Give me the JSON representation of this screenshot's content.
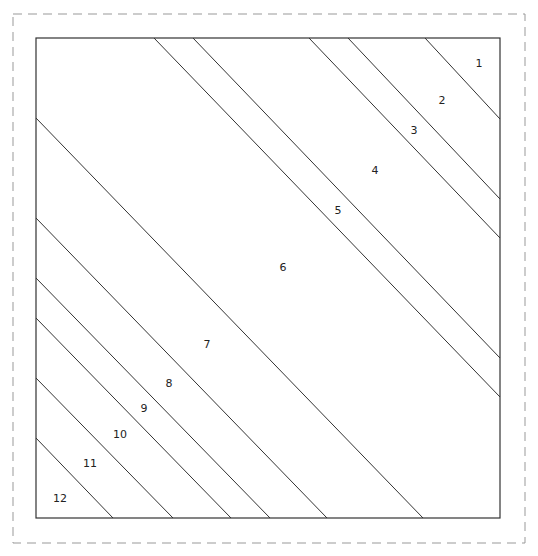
{
  "colors": {
    "background": "#ffffff",
    "outline": "#333333",
    "dashed_border": "#999999",
    "label": "#222222"
  },
  "outer_border": {
    "x": 13,
    "y": 14,
    "width": 512,
    "height": 529,
    "style": "dashed"
  },
  "square": {
    "x": 36,
    "y": 38,
    "width": 464,
    "height": 480
  },
  "lines": [
    {
      "x1": 425,
      "y1": 38,
      "x2": 500,
      "y2": 119
    },
    {
      "x1": 348,
      "y1": 38,
      "x2": 500,
      "y2": 199
    },
    {
      "x1": 309,
      "y1": 38,
      "x2": 500,
      "y2": 238
    },
    {
      "x1": 193,
      "y1": 38,
      "x2": 500,
      "y2": 358
    },
    {
      "x1": 154,
      "y1": 38,
      "x2": 500,
      "y2": 397
    },
    {
      "x1": 36,
      "y1": 118,
      "x2": 423,
      "y2": 518
    },
    {
      "x1": 36,
      "y1": 218,
      "x2": 327,
      "y2": 518
    },
    {
      "x1": 36,
      "y1": 278,
      "x2": 270,
      "y2": 518
    },
    {
      "x1": 36,
      "y1": 318,
      "x2": 231,
      "y2": 518
    },
    {
      "x1": 36,
      "y1": 378,
      "x2": 173,
      "y2": 518
    },
    {
      "x1": 36,
      "y1": 438,
      "x2": 113,
      "y2": 518
    }
  ],
  "regions": [
    {
      "label": "1",
      "x": 479,
      "y": 67
    },
    {
      "label": "2",
      "x": 442,
      "y": 104
    },
    {
      "label": "3",
      "x": 414,
      "y": 134
    },
    {
      "label": "4",
      "x": 375,
      "y": 174
    },
    {
      "label": "5",
      "x": 338,
      "y": 214
    },
    {
      "label": "6",
      "x": 283,
      "y": 271
    },
    {
      "label": "7",
      "x": 207,
      "y": 348
    },
    {
      "label": "8",
      "x": 169,
      "y": 387
    },
    {
      "label": "9",
      "x": 144,
      "y": 412
    },
    {
      "label": "10",
      "x": 120,
      "y": 438
    },
    {
      "label": "11",
      "x": 90,
      "y": 467
    },
    {
      "label": "12",
      "x": 60,
      "y": 502
    }
  ]
}
